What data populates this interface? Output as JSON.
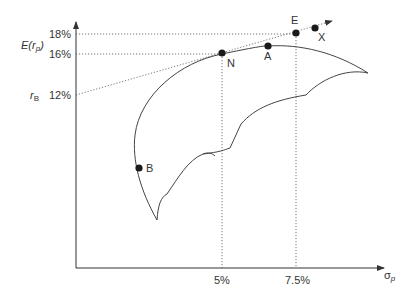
{
  "diagram": {
    "type": "efficient-frontier-capital-market-line",
    "y_axis": {
      "label_main": "E(r",
      "label_sub": "p",
      "label_close": ")",
      "ticks": [
        {
          "label": "18%",
          "value": 18
        },
        {
          "label": "16%",
          "value": 16
        },
        {
          "label": "12%",
          "value": 12
        }
      ],
      "risk_free_label": "r",
      "risk_free_sub": "B"
    },
    "x_axis": {
      "label_main": "σ",
      "label_sub": "p",
      "ticks": [
        {
          "label": "5%",
          "value": 5
        },
        {
          "label": "7.5%",
          "value": 7.5
        }
      ]
    },
    "points": [
      {
        "name": "N",
        "label": "N",
        "sigma": 5,
        "return": 16
      },
      {
        "name": "A",
        "label": "A"
      },
      {
        "name": "E",
        "label": "E",
        "sigma": 7.5,
        "return": 18
      },
      {
        "name": "X",
        "label": "X"
      },
      {
        "name": "B",
        "label": "B"
      }
    ],
    "lines": [
      {
        "name": "capital-allocation-line",
        "from": "r_B 12%",
        "through": [
          "N",
          "E",
          "X"
        ],
        "style": "dotted-arrow"
      },
      {
        "name": "efficient-frontier",
        "style": "solid-curve"
      },
      {
        "name": "feasible-set-inner-boundary",
        "style": "scalloped-curve"
      }
    ]
  }
}
